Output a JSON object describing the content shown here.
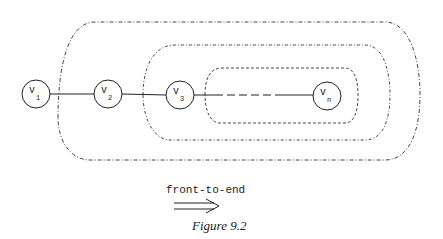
{
  "figure": {
    "caption": "Figure 9.2",
    "direction_label": "front-to-end",
    "arrow_icon": "double-right-arrow",
    "nodes": [
      {
        "id": "v1",
        "label": "v",
        "sub": "1"
      },
      {
        "id": "v2",
        "label": "v",
        "sub": "2"
      },
      {
        "id": "v3",
        "label": "v",
        "sub": "3"
      },
      {
        "id": "vn",
        "label": "v",
        "sub": "n"
      }
    ],
    "regions": [
      "outer-dashed-region",
      "middle-dashed-region",
      "inner-dashed-region"
    ]
  }
}
